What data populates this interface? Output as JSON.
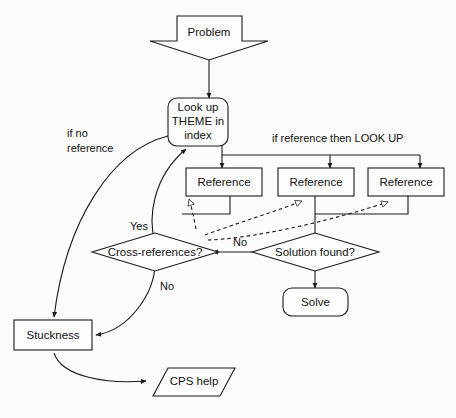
{
  "diagram": {
    "background_color": "#fcfcfc",
    "line_color": "#1a1a1a",
    "shape_fill": "#fdfdfd",
    "nodes": {
      "problem": {
        "label": "Problem",
        "shape": "down-arrow-block"
      },
      "lookup_theme": {
        "label_line1": "Look up",
        "label_line2": "THEME in",
        "label_line3": "index",
        "shape": "rounded-rect"
      },
      "reference_1": {
        "label": "Reference",
        "shape": "rect"
      },
      "reference_2": {
        "label": "Reference",
        "shape": "rect"
      },
      "reference_3": {
        "label": "Reference",
        "shape": "rect"
      },
      "cross_references": {
        "label": "Cross-references?",
        "shape": "diamond"
      },
      "solution_found": {
        "label": "Solution found?",
        "shape": "diamond"
      },
      "solve": {
        "label": "Solve",
        "shape": "rounded-rect"
      },
      "stuckness": {
        "label": "Stuckness",
        "shape": "rect"
      },
      "cps_help": {
        "label": "CPS help",
        "shape": "parallelogram"
      }
    },
    "edge_labels": {
      "if_no_reference_line1": "if no",
      "if_no_reference_line2": "reference",
      "if_reference_then_lookup": "if reference then LOOK UP",
      "yes_cross_references": "Yes",
      "no_solution_found": "No",
      "no_cross_references": "No"
    }
  }
}
